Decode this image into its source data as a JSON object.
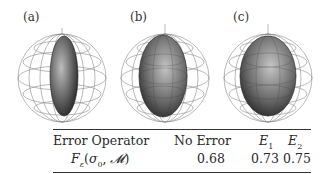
{
  "figure": {
    "panels": [
      {
        "label": "(a)",
        "description": "Bloch sphere wireframe with thin prolate ellipsoid inside",
        "ellipsoid_rx": 14,
        "ellipsoid_ry": 40
      },
      {
        "label": "(b)",
        "description": "Bloch sphere wireframe with medium ellipsoid inside",
        "ellipsoid_rx": 24,
        "ellipsoid_ry": 41
      },
      {
        "label": "(c)",
        "description": "Bloch sphere wireframe with wider ellipsoid inside",
        "ellipsoid_rx": 28,
        "ellipsoid_ry": 40
      }
    ]
  },
  "table": {
    "header": [
      "Error Operator",
      "No Error",
      "E1",
      "E2"
    ],
    "row_label": "Fε(σ0, M)",
    "values": [
      "0.68",
      "0.73",
      "0.75"
    ]
  }
}
